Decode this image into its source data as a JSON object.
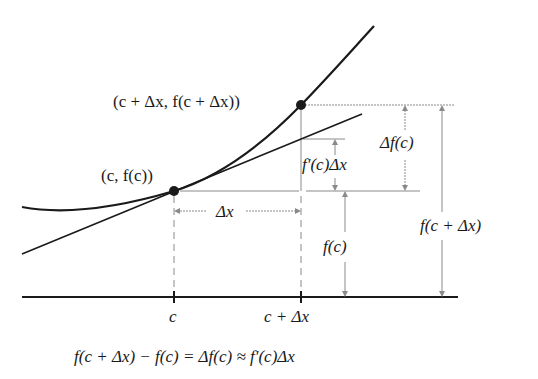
{
  "diagram": {
    "type": "differential-approximation",
    "labels": {
      "point_c": "(c, f(c))",
      "point_c_dx": "(c + Δx, f(c + Δx))",
      "delta_x": "Δx",
      "delta_f": "Δf(c)",
      "fprime_dx": "f′(c)Δx",
      "f_c": "f(c)",
      "f_c_dx": "f(c + Δx)",
      "tick_c": "c",
      "tick_c_dx": "c + Δx",
      "equation": "f(c + Δx) − f(c) = Δf(c) ≈ f′(c)Δx"
    },
    "colors": {
      "curve": "#1a1a1a",
      "guide": "#8a8a8a",
      "text": "#1a1a1a"
    }
  }
}
